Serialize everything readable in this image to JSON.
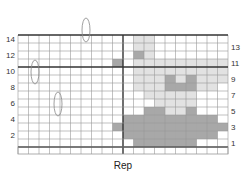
{
  "chart_data": {
    "type": "heatmap",
    "title": "",
    "xlabel": "Rep",
    "columns": 20,
    "rows": 14,
    "left_row_labels": [
      "14",
      "12",
      "10",
      "8",
      "6",
      "4",
      "2"
    ],
    "right_row_labels": [
      "13",
      "11",
      "9",
      "7",
      "5",
      "3",
      "1"
    ],
    "colors": {
      "0": "#ffffff",
      "1": "#e2e2e2",
      "2": "#a8a8a8"
    },
    "legend": {
      "0": "empty",
      "1": "light shade",
      "2": "medium shade"
    },
    "grid": [
      [
        0,
        0,
        0,
        0,
        0,
        0,
        0,
        0,
        0,
        0,
        0,
        1,
        1,
        0,
        0,
        0,
        0,
        0,
        0,
        0
      ],
      [
        0,
        0,
        0,
        0,
        0,
        0,
        0,
        0,
        0,
        0,
        0,
        1,
        1,
        0,
        0,
        0,
        0,
        0,
        0,
        0
      ],
      [
        0,
        0,
        0,
        0,
        0,
        0,
        0,
        0,
        0,
        0,
        0,
        2,
        1,
        0,
        0,
        0,
        0,
        0,
        0,
        0
      ],
      [
        0,
        0,
        0,
        0,
        0,
        0,
        0,
        0,
        0,
        2,
        0,
        1,
        1,
        1,
        1,
        1,
        1,
        1,
        1,
        1
      ],
      [
        0,
        0,
        0,
        0,
        0,
        0,
        0,
        0,
        0,
        0,
        0,
        1,
        1,
        1,
        1,
        1,
        1,
        1,
        1,
        1
      ],
      [
        0,
        0,
        0,
        0,
        0,
        0,
        0,
        0,
        0,
        0,
        0,
        1,
        1,
        1,
        2,
        1,
        2,
        1,
        1,
        1
      ],
      [
        0,
        0,
        0,
        0,
        0,
        0,
        0,
        0,
        0,
        0,
        0,
        1,
        1,
        1,
        2,
        2,
        2,
        1,
        1,
        0
      ],
      [
        0,
        0,
        0,
        0,
        0,
        0,
        0,
        0,
        0,
        0,
        0,
        0,
        1,
        1,
        1,
        1,
        1,
        0,
        0,
        0
      ],
      [
        0,
        0,
        0,
        0,
        0,
        0,
        0,
        0,
        0,
        0,
        0,
        0,
        0,
        1,
        1,
        1,
        1,
        0,
        0,
        0
      ],
      [
        0,
        0,
        0,
        0,
        0,
        0,
        0,
        0,
        0,
        0,
        0,
        0,
        2,
        2,
        1,
        1,
        2,
        0,
        0,
        0
      ],
      [
        0,
        0,
        0,
        0,
        0,
        0,
        0,
        0,
        0,
        0,
        2,
        2,
        2,
        2,
        2,
        2,
        2,
        2,
        2,
        0
      ],
      [
        0,
        0,
        0,
        0,
        0,
        0,
        0,
        0,
        0,
        2,
        2,
        2,
        2,
        2,
        2,
        2,
        2,
        2,
        2,
        2
      ],
      [
        0,
        0,
        0,
        0,
        0,
        0,
        0,
        0,
        0,
        0,
        2,
        2,
        2,
        2,
        2,
        2,
        2,
        2,
        2,
        0
      ],
      [
        0,
        0,
        0,
        0,
        0,
        0,
        0,
        0,
        0,
        0,
        0,
        2,
        2,
        2,
        2,
        2,
        2,
        0,
        0,
        0
      ]
    ],
    "dividers": {
      "vertical_after_col": 10,
      "horizontal_above_row": 10
    },
    "ovals": [
      {
        "cx": 86,
        "cy": 30,
        "rx": 4,
        "ry": 12
      },
      {
        "cx": 35,
        "cy": 72,
        "rx": 4,
        "ry": 12
      },
      {
        "cx": 58,
        "cy": 104,
        "rx": 4,
        "ry": 12
      }
    ]
  }
}
